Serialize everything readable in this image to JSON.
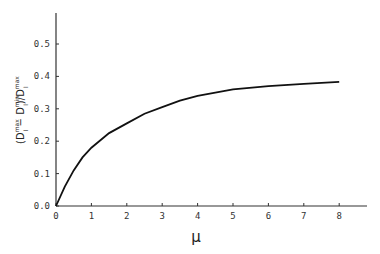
{
  "chart_data": {
    "type": "line",
    "title": "",
    "xlabel": "μ",
    "ylabel": "(D_l^max − D_l^min) / D_l^max",
    "ylabel_parts": {
      "open": "(D",
      "sup1": "max",
      "sub1": "l",
      "minus": " − D",
      "sup2": "min",
      "sub2": "l",
      "mid": ")/D",
      "sup3": "max",
      "sub3": "l"
    },
    "xlim": [
      0,
      8.8
    ],
    "ylim": [
      0,
      0.6
    ],
    "x_ticks": [
      "0",
      "1",
      "2",
      "3",
      "4",
      "5",
      "6",
      "7",
      "8"
    ],
    "y_ticks": [
      "0.0",
      "0.1",
      "0.2",
      "0.3",
      "0.4",
      "0.5"
    ],
    "grid": false,
    "legend": null,
    "series": [
      {
        "name": "curve",
        "x": [
          0,
          0.25,
          0.5,
          0.75,
          1,
          1.5,
          2,
          2.5,
          3,
          3.5,
          4,
          4.5,
          5,
          6,
          7,
          8
        ],
        "values": [
          0,
          0.06,
          0.11,
          0.15,
          0.18,
          0.225,
          0.255,
          0.285,
          0.305,
          0.325,
          0.34,
          0.35,
          0.36,
          0.37,
          0.377,
          0.383
        ]
      }
    ]
  }
}
